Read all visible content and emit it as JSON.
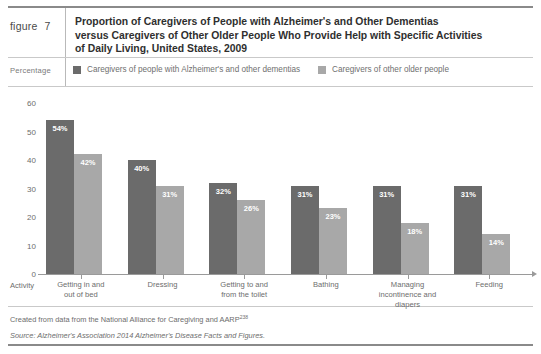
{
  "header": {
    "figure_word": "figure",
    "figure_number": "7",
    "title_lines": [
      "Proportion of Caregivers of People with Alzheimer's and Other Dementias",
      "versus Caregivers of Other Older People Who Provide Help with Specific Activities",
      "of Daily Living, United States, 2009"
    ]
  },
  "legend": {
    "y_axis_caption": "Percentage",
    "x_axis_caption": "Activity",
    "items": [
      {
        "label": "Caregivers of people with Alzheimer's and other dementias",
        "color": "#6b6b6b"
      },
      {
        "label": "Caregivers of other older people",
        "color": "#a8a8a8"
      }
    ]
  },
  "footnotes": {
    "created": "Created from data from the National Alliance for Caregiving and AARP",
    "created_superscript": "238",
    "source": "Source: Alzheimer's Association 2014 Alzheimer's Disease Facts and Figures."
  },
  "chart_data": {
    "type": "bar",
    "title": "Proportion of Caregivers of People with Alzheimer's and Other Dementias versus Caregivers of Other Older People Who Provide Help with Specific Activities of Daily Living, United States, 2009",
    "xlabel": "Activity",
    "ylabel": "Percentage",
    "ylim": [
      0,
      60
    ],
    "yticks": [
      0,
      10,
      20,
      30,
      40,
      50,
      60
    ],
    "grid": false,
    "legend_position": "top",
    "categories": [
      "Getting in and out of bed",
      "Dressing",
      "Getting to and from the toilet",
      "Bathing",
      "Managing incontinence and diapers",
      "Feeding"
    ],
    "category_lines": [
      [
        "Getting in and",
        "out of bed"
      ],
      [
        "Dressing"
      ],
      [
        "Getting to and",
        "from the toilet"
      ],
      [
        "Bathing"
      ],
      [
        "Managing",
        "incontinence and diapers"
      ],
      [
        "Feeding"
      ]
    ],
    "series": [
      {
        "name": "Caregivers of people with Alzheimer's and other dementias",
        "color": "#6b6b6b",
        "values": [
          54,
          40,
          32,
          31,
          31,
          31
        ],
        "labels": [
          "54%",
          "40%",
          "32%",
          "31%",
          "31%",
          "31%"
        ]
      },
      {
        "name": "Caregivers of other older people",
        "color": "#a8a8a8",
        "values": [
          42,
          31,
          26,
          23,
          18,
          14
        ],
        "labels": [
          "42%",
          "31%",
          "26%",
          "23%",
          "18%",
          "14%"
        ]
      }
    ]
  }
}
